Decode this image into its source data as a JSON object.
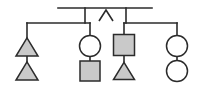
{
  "diagram": {
    "type": "pedigree",
    "background_color": "#ffffff",
    "line_color": "#2b2b2b",
    "affected_fill": "#c9c9c9",
    "unaffected_fill": "#ffffff",
    "consanguinity_marker": "∧",
    "legend": {
      "square": "male",
      "circle": "female",
      "triangle": "pregnancy-or-unknown-sex",
      "shaded": "affected",
      "open": "unaffected"
    },
    "symbols": [
      {
        "id": "gen2-individual-1",
        "shape": "triangle",
        "status": "affected",
        "generation": 2,
        "sibship": "left",
        "cx": 27,
        "cy": 47,
        "size": 22
      },
      {
        "id": "gen3-individual-1",
        "shape": "triangle",
        "status": "affected",
        "generation": 3,
        "sibship": "left",
        "cx": 27,
        "cy": 71,
        "size": 22
      },
      {
        "id": "gen2-individual-2",
        "shape": "circle",
        "status": "unaffected",
        "generation": 2,
        "sibship": "left",
        "cx": 90,
        "cy": 46,
        "size": 21
      },
      {
        "id": "gen3-individual-2",
        "shape": "square",
        "status": "affected",
        "generation": 3,
        "sibship": "left",
        "cx": 90,
        "cy": 71,
        "size": 20
      },
      {
        "id": "gen2-individual-3",
        "shape": "square",
        "status": "affected",
        "generation": 2,
        "sibship": "right",
        "cx": 124,
        "cy": 45,
        "size": 21
      },
      {
        "id": "gen3-individual-3",
        "shape": "triangle",
        "status": "affected",
        "generation": 3,
        "sibship": "right",
        "cx": 124,
        "cy": 71,
        "size": 21
      },
      {
        "id": "gen2-individual-4",
        "shape": "circle",
        "status": "unaffected",
        "generation": 2,
        "sibship": "right",
        "cx": 177,
        "cy": 46,
        "size": 21
      },
      {
        "id": "gen3-individual-4",
        "shape": "circle",
        "status": "unaffected",
        "generation": 3,
        "sibship": "right",
        "cx": 177,
        "cy": 71,
        "size": 21
      }
    ],
    "connectors": [
      {
        "id": "partnership-line",
        "path": "M 58 8 L 152 8"
      },
      {
        "id": "left-descent-drop",
        "path": "M 85 8 L 85 23"
      },
      {
        "id": "right-descent-drop",
        "path": "M 126 8 L 126 23"
      },
      {
        "id": "left-sibship-bar",
        "path": "M 27 23 L 90 23"
      },
      {
        "id": "right-sibship-bar",
        "path": "M 124 23 L 177 23"
      },
      {
        "id": "left-sib1-stem",
        "path": "M 27 23 L 27 38"
      },
      {
        "id": "left-sib2-stem",
        "path": "M 90 23 L 90 35"
      },
      {
        "id": "right-sib1-stem",
        "path": "M 124 23 L 124 35"
      },
      {
        "id": "right-sib2-stem",
        "path": "M 177 23 L 177 35"
      },
      {
        "id": "left-sib1-child-stem",
        "path": "M 27 55 L 27 62"
      },
      {
        "id": "left-sib2-child-stem",
        "path": "M 90 57 L 90 61"
      },
      {
        "id": "right-sib1-child-stem",
        "path": "M 124 56 L 124 62"
      },
      {
        "id": "right-sib2-child-stem",
        "path": "M 177 57 L 177 61"
      }
    ],
    "consanguinity": {
      "id": "consanguinity-chevron",
      "path": "M 99 21 L 106 10 L 113 21",
      "apex_x": 106,
      "apex_y": 10
    }
  }
}
